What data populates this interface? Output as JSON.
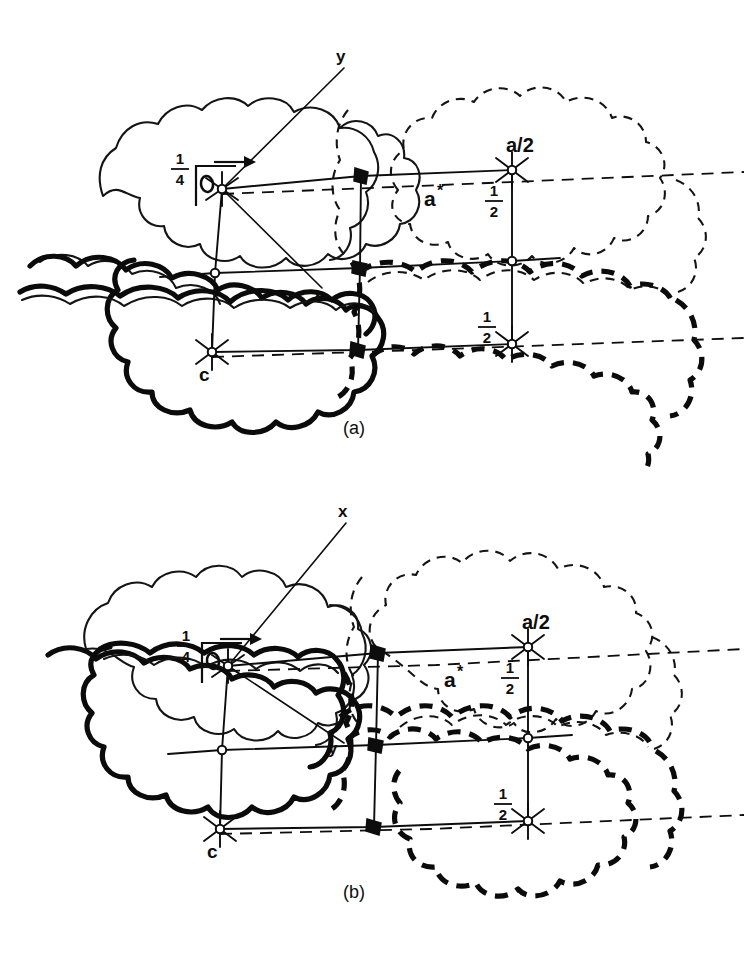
{
  "figure": {
    "background_color": "#ffffff",
    "ink_color": "#0d0d0d",
    "width": 752,
    "height": 954
  },
  "panels": [
    {
      "id": "a",
      "caption": "(a)",
      "caption_pos": {
        "x": 356,
        "y": 434
      },
      "labels": {
        "origin": "O",
        "height_quarter": {
          "numerator": "1",
          "denominator": "4"
        },
        "axis_upper": "y",
        "axis_lower": "x",
        "reciprocal_vector": "a",
        "reciprocal_star": "*",
        "a_half": "a/2",
        "c_vector": "c",
        "half_top": {
          "numerator": "1",
          "denominator": "2"
        },
        "half_bottom": {
          "numerator": "1",
          "denominator": "2"
        }
      },
      "label_positions": {
        "origin": {
          "x": 206,
          "y": 186
        },
        "height_quarter": {
          "x": 180,
          "y": 170
        },
        "axis_upper": {
          "x": 340,
          "y": 60
        },
        "axis_lower": {
          "x": 318,
          "y": 297
        },
        "reciprocal_vector": {
          "x": 428,
          "y": 204
        },
        "a_half": {
          "x": 510,
          "y": 155
        },
        "c_vector": {
          "x": 205,
          "y": 377
        },
        "half_top": {
          "x": 494,
          "y": 198
        },
        "half_bottom": {
          "x": 487,
          "y": 325
        }
      }
    },
    {
      "id": "b",
      "caption": "(b)",
      "caption_pos": {
        "x": 356,
        "y": 898
      },
      "labels": {
        "origin": "O",
        "height_quarter": {
          "numerator": "1",
          "denominator": "4"
        },
        "axis_upper": "x",
        "axis_lower": "y",
        "reciprocal_vector": "a",
        "reciprocal_star": "*",
        "a_half": "a/2",
        "c_vector": "c",
        "half_top": {
          "numerator": "1",
          "denominator": "2"
        },
        "half_bottom": {
          "numerator": "1",
          "denominator": "2"
        }
      },
      "label_positions": {
        "origin": {
          "x": 206,
          "y": 186
        },
        "height_quarter": {
          "x": 180,
          "y": 170
        },
        "axis_upper": {
          "x": 343,
          "y": 38
        },
        "axis_lower": {
          "x": 333,
          "y": 273
        },
        "reciprocal_vector": {
          "x": 448,
          "y": 208
        },
        "a_half": {
          "x": 527,
          "y": 152
        },
        "c_vector": {
          "x": 208,
          "y": 380
        },
        "half_top": {
          "x": 509,
          "y": 200
        },
        "half_bottom": {
          "x": 498,
          "y": 323
        }
      }
    }
  ],
  "lattice": {
    "description": "Three-column by three-row net of unit-cell edges drawn as slightly sheared quadrilaterals",
    "nodes": [
      {
        "name": "origin",
        "x": 222,
        "y": 189,
        "marker": "star-ring",
        "panel": "both"
      },
      {
        "name": "mid-top",
        "x": 361,
        "y": 176,
        "marker": "blob",
        "panel": "both"
      },
      {
        "name": "a-half",
        "x": 512,
        "y": 170,
        "marker": "star-ring",
        "panel": "both"
      },
      {
        "name": "left-middle",
        "x": 215,
        "y": 273,
        "marker": "ring",
        "panel": "both"
      },
      {
        "name": "center-middle",
        "x": 360,
        "y": 268,
        "marker": "blob",
        "panel": "both"
      },
      {
        "name": "right-middle",
        "x": 512,
        "y": 261,
        "marker": "ring",
        "panel": "both"
      },
      {
        "name": "c-vertex",
        "x": 212,
        "y": 352,
        "marker": "star-ring",
        "panel": "both"
      },
      {
        "name": "mid-bottom",
        "x": 358,
        "y": 350,
        "marker": "blob",
        "panel": "both"
      },
      {
        "name": "bottom-right",
        "x": 512,
        "y": 344,
        "marker": "star-ring",
        "panel": "both"
      }
    ]
  },
  "legend_notes": {
    "thin_solid": "molecule outline at height 1/4, front layer",
    "thick_solid": "molecule outline, bold front layer",
    "thin_dashed": "molecule outline, translated copy at a/2",
    "thick_dashed": "molecule outline, bold translated copy"
  }
}
